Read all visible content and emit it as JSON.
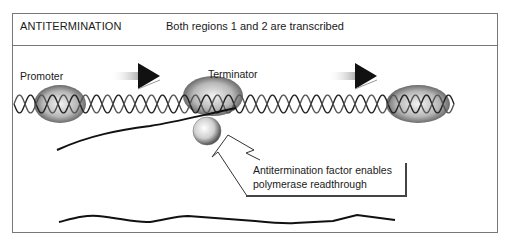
{
  "header": {
    "title": "ANTITERMINATION",
    "subtitle": "Both regions 1 and 2 are transcribed"
  },
  "labels": {
    "promoter": "Promoter",
    "terminator": "Terminator"
  },
  "callout": {
    "line1": "Antitermination factor enables",
    "line2": "polymerase readthrough"
  },
  "icons": {
    "direction_arrows": [
      "arrow-right-icon",
      "arrow-right-icon"
    ],
    "dna": "dna-helix-icon",
    "polymerase": "rna-polymerase-icon",
    "antitermination_factor": "sphere-icon",
    "callout_arrow": "curved-arrow-icon"
  }
}
